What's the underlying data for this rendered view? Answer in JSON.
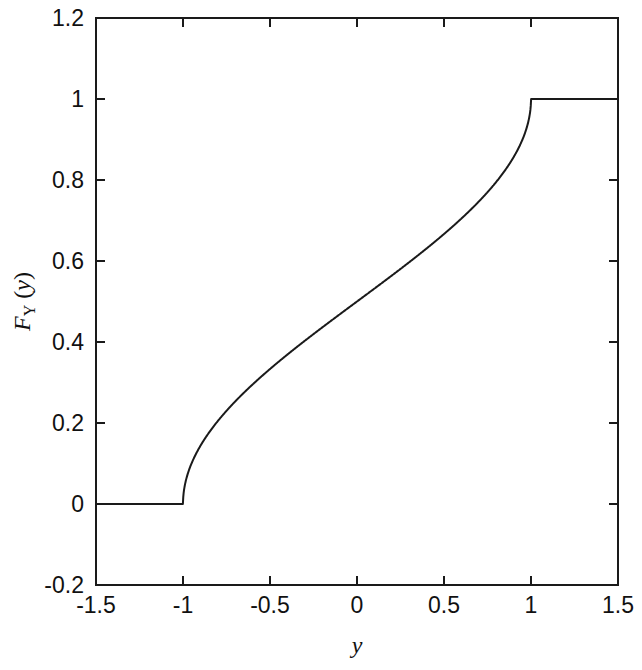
{
  "chart_data": {
    "type": "line",
    "title": "",
    "subtitle": "",
    "xlabel": "y",
    "ylabel": "F_Y (y)",
    "ylabel_parts": {
      "main": "F",
      "subscript": "Y",
      "open_paren": " (",
      "arg": "y",
      "close_paren": ")"
    },
    "xlim": [
      -1.5,
      1.5
    ],
    "ylim": [
      -0.2,
      1.2
    ],
    "xticks": [
      -1.5,
      -1,
      -0.5,
      0,
      0.5,
      1,
      1.5
    ],
    "xticklabels": [
      "-1.5",
      "-1",
      "-0.5",
      "0",
      "0.5",
      "1",
      "1.5"
    ],
    "yticks": [
      -0.2,
      0,
      0.2,
      0.4,
      0.6,
      0.8,
      1,
      1.2
    ],
    "yticklabels": [
      "-0.2",
      "0",
      "0.2",
      "0.4",
      "0.6",
      "0.8",
      "1",
      "1.2"
    ],
    "grid": false,
    "legend": null,
    "legend_position": "none",
    "line_color": "#1a1a1a",
    "line_width": 2,
    "axis_color": "#1a1a1a",
    "background_color": "#ffffff",
    "series": [
      {
        "name": "F_Y (y)",
        "x": [
          -1.5,
          -1.4,
          -1.3,
          -1.2,
          -1.1,
          -1.0,
          -0.999,
          -0.99,
          -0.98,
          -0.96,
          -0.94,
          -0.92,
          -0.9,
          -0.85,
          -0.8,
          -0.75,
          -0.7,
          -0.65,
          -0.6,
          -0.55,
          -0.5,
          -0.45,
          -0.4,
          -0.35,
          -0.3,
          -0.25,
          -0.2,
          -0.15,
          -0.1,
          -0.05,
          0.0,
          0.05,
          0.1,
          0.15,
          0.2,
          0.25,
          0.3,
          0.35,
          0.4,
          0.45,
          0.5,
          0.55,
          0.6,
          0.65,
          0.7,
          0.75,
          0.8,
          0.85,
          0.9,
          0.92,
          0.94,
          0.96,
          0.98,
          0.99,
          0.999,
          1.0,
          1.1,
          1.2,
          1.3,
          1.4,
          1.5
        ],
        "y": [
          0.0,
          0.0,
          0.0,
          0.0,
          0.0,
          0.0,
          0.0143,
          0.0451,
          0.0639,
          0.0905,
          0.1108,
          0.1281,
          0.1435,
          0.1762,
          0.2048,
          0.2313,
          0.2563,
          0.2803,
          0.304,
          0.3267,
          0.3333,
          0.3515,
          0.369,
          0.3862,
          0.4031,
          0.4196,
          0.4359,
          0.4521,
          0.4681,
          0.4841,
          0.5,
          0.5159,
          0.5319,
          0.5479,
          0.5641,
          0.5804,
          0.5969,
          0.6138,
          0.631,
          0.6485,
          0.6667,
          0.6733,
          0.696,
          0.7197,
          0.7437,
          0.7687,
          0.7952,
          0.8238,
          0.8565,
          0.8719,
          0.8892,
          0.9095,
          0.9361,
          0.9549,
          0.9857,
          1.0,
          1.0,
          1.0,
          1.0,
          1.0,
          1.0
        ]
      }
    ],
    "key_points": [
      {
        "x": -1.0,
        "y": 0.0,
        "note": "left corner: flat zero meets vertical tangent rise"
      },
      {
        "x": 0.0,
        "y": 0.5,
        "note": "median"
      },
      {
        "x": 1.0,
        "y": 1.0,
        "note": "right corner: vertical tangent meets flat one"
      }
    ]
  }
}
